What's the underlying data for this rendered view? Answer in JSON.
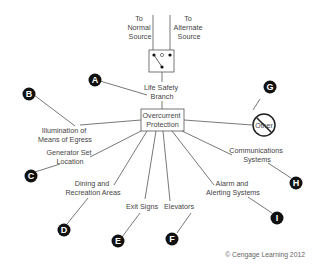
{
  "diagram": {
    "sources": {
      "normal": [
        "To",
        "Normal",
        "Source"
      ],
      "alternate": [
        "To",
        "Alternate",
        "Source"
      ]
    },
    "branch_label": [
      "Life Safety",
      "Branch"
    ],
    "center_box": [
      "Overcurrent",
      "Protection"
    ],
    "prohibited_label": "Other",
    "items": [
      {
        "letter": "A",
        "label": [
          "Life Safety",
          "Branch"
        ]
      },
      {
        "letter": "B",
        "label": [
          "Illumination of",
          "Means of Egress"
        ]
      },
      {
        "letter": "C",
        "label": [
          "Generator Set",
          "Location"
        ]
      },
      {
        "letter": "D",
        "label": [
          "Dining and",
          "Recreation Areas"
        ]
      },
      {
        "letter": "E",
        "label": [
          "Exit Signs"
        ]
      },
      {
        "letter": "F",
        "label": [
          "Elevators"
        ]
      },
      {
        "letter": "G",
        "label": [
          "Other"
        ]
      },
      {
        "letter": "H",
        "label": [
          "Communications",
          "Systems"
        ]
      },
      {
        "letter": "I",
        "label": [
          "Alarm and",
          "Alerting Systems"
        ]
      }
    ],
    "copyright": "© Cengage Learning 2012"
  }
}
